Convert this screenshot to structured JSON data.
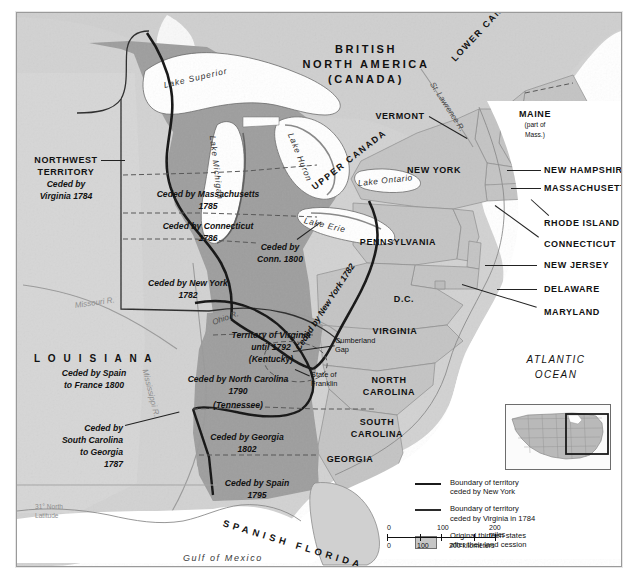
{
  "map": {
    "title_region": "BRITISH NORTH AMERICA (CANADA)",
    "regions": {
      "british_north_america_l1": "BRITISH",
      "british_north_america_l2": "NORTH AMERICA",
      "british_north_america_l3": "(CANADA)",
      "lower_canada": "LOWER CANADA",
      "upper_canada": "UPPER CANADA",
      "louisiana": "L O U I S I A N A",
      "spanish_florida": "SPANISH FLORIDA",
      "atlantic_ocean_l1": "ATLANTIC",
      "atlantic_ocean_l2": "OCEAN",
      "gulf_of_mexico": "Gulf of Mexico"
    },
    "water_labels": {
      "lake_superior": "Lake Superior",
      "lake_michigan": "Lake Michigan",
      "lake_huron": "Lake Huron",
      "lake_erie": "Lake Erie",
      "lake_ontario": "Lake Ontario",
      "st_lawrence_river": "St. Lawrence R.",
      "missouri_river": "Missouri R.",
      "mississippi_river": "Mississippi R.",
      "ohio_river": "Ohio R."
    },
    "cessions": [
      {
        "id": "northwest-territory",
        "l1": "NORTHWEST",
        "l2": "TERRITORY",
        "l3": "Ceded by",
        "l4": "Virginia 1784"
      },
      {
        "id": "massachusetts",
        "l1": "Ceded by Massachusetts",
        "l2": "1785"
      },
      {
        "id": "connecticut",
        "l1": "Ceded by Connecticut",
        "l2": "1786"
      },
      {
        "id": "connecticut-reserve",
        "l1": "Ceded by",
        "l2": "Conn. 1800"
      },
      {
        "id": "new-york",
        "l1": "Ceded by New York",
        "l2": "1782"
      },
      {
        "id": "virginia-kentucky",
        "l1": "Territory of Virginia",
        "l2": "until 1792",
        "l3": "(Kentucky)"
      },
      {
        "id": "north-carolina",
        "l1": "Ceded by North Carolina",
        "l2": "1790",
        "l3": "(Tennessee)"
      },
      {
        "id": "south-carolina",
        "l1": "Ceded by",
        "l2": "South Carolina",
        "l3": "to Georgia",
        "l4": "1787"
      },
      {
        "id": "georgia",
        "l1": "Ceded by Georgia",
        "l2": "1802"
      },
      {
        "id": "spain",
        "l1": "Ceded by Spain",
        "l2": "1795"
      },
      {
        "id": "louisiana-spain-france",
        "l1": "Ceded by Spain",
        "l2": "to France 1800"
      },
      {
        "id": "new-york-boundary",
        "l1": "Ceded by New York 1782"
      }
    ],
    "states": [
      {
        "id": "vermont",
        "label": "VERMONT"
      },
      {
        "id": "new-york",
        "label": "NEW YORK"
      },
      {
        "id": "maine",
        "l1": "MAINE",
        "l2": "(part of",
        "l3": "Mass.)"
      },
      {
        "id": "new-hampshire",
        "label": "NEW HAMPSHIRE"
      },
      {
        "id": "massachusetts",
        "label": "MASSACHUSETTS"
      },
      {
        "id": "rhode-island",
        "label": "RHODE ISLAND"
      },
      {
        "id": "connecticut",
        "label": "CONNECTICUT"
      },
      {
        "id": "pennsylvania",
        "label": "PENNSYLVANIA"
      },
      {
        "id": "new-jersey",
        "label": "NEW JERSEY"
      },
      {
        "id": "delaware",
        "label": "DELAWARE"
      },
      {
        "id": "maryland",
        "label": "MARYLAND"
      },
      {
        "id": "dc",
        "label": "D.C."
      },
      {
        "id": "virginia",
        "label": "VIRGINIA"
      },
      {
        "id": "north-carolina",
        "l1": "NORTH",
        "l2": "CAROLINA"
      },
      {
        "id": "south-carolina",
        "l1": "SOUTH",
        "l2": "CAROLINA"
      },
      {
        "id": "georgia",
        "label": "GEORGIA"
      }
    ],
    "places": {
      "cumberland_gap_l1": "Cumberland",
      "cumberland_gap_l2": "Gap",
      "state_of_franklin_l1": "State of",
      "state_of_franklin_l2": "Franklin",
      "latitude_l1": "31° North",
      "latitude_l2": "Latitude"
    }
  },
  "legend": {
    "items": [
      {
        "key": "thick-line",
        "l1": "Boundary of territory",
        "l2": "ceded by New York"
      },
      {
        "key": "thin-line",
        "l1": "Boundary of territory",
        "l2": "ceded by Virginia in 1784"
      },
      {
        "key": "swatch",
        "l1": "Original thirteen states",
        "l2": "after their land cession"
      }
    ]
  },
  "scale": {
    "miles": {
      "t0": "0",
      "t1": "100",
      "t2": "200 miles"
    },
    "kilometers": {
      "t0": "0",
      "t1": "100",
      "t2": "200 kilometers"
    }
  },
  "colors": {
    "ceded_territory": "#9e9e9e",
    "original_states": "#c4c4c4",
    "foreign_land": "#d0d0d0",
    "water": "#ffffff",
    "boundary_ny": "#141414",
    "boundary_va": "#2a2a2a",
    "frame": "#9a9a9a"
  }
}
